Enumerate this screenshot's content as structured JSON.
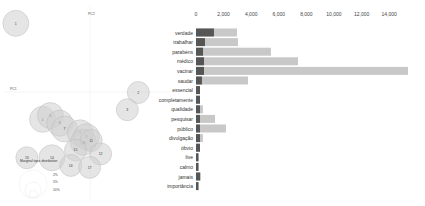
{
  "map": {
    "xaxis_label": "PC1",
    "yaxis_label": "PC2",
    "legend_title": "Marginal topic distribution",
    "legend_sizes": [
      "2%",
      "5%",
      "10%"
    ],
    "colors": {
      "circle_fill": "#d0d0d0",
      "circle_stroke": "#bdbdbd",
      "center": "#444444"
    },
    "topics": [
      {
        "id": "1",
        "x": 0.05,
        "y": 0.92,
        "size": 3
      },
      {
        "id": "2",
        "x": 0.83,
        "y": 0.56,
        "size": 2
      },
      {
        "id": "3",
        "x": 0.76,
        "y": 0.47,
        "size": 2
      },
      {
        "id": "4",
        "x": 0.22,
        "y": 0.42,
        "size": 3
      },
      {
        "id": "5",
        "x": 0.27,
        "y": 0.44,
        "size": 3
      },
      {
        "id": "6",
        "x": 0.33,
        "y": 0.4,
        "size": 3
      },
      {
        "id": "7",
        "x": 0.36,
        "y": 0.37,
        "size": 3
      },
      {
        "id": "8",
        "x": 0.46,
        "y": 0.35,
        "size": 3
      },
      {
        "id": "9",
        "x": 0.5,
        "y": 0.33,
        "size": 3
      },
      {
        "id": "10",
        "x": 0.48,
        "y": 0.3,
        "size": 3
      },
      {
        "id": "11",
        "x": 0.53,
        "y": 0.31,
        "size": 2
      },
      {
        "id": "12",
        "x": 0.59,
        "y": 0.24,
        "size": 2
      },
      {
        "id": "13",
        "x": 0.12,
        "y": 0.22,
        "size": 2
      },
      {
        "id": "14",
        "x": 0.28,
        "y": 0.22,
        "size": 3
      },
      {
        "id": "15",
        "x": 0.43,
        "y": 0.26,
        "size": 2
      },
      {
        "id": "16",
        "x": 0.4,
        "y": 0.18,
        "size": 2
      },
      {
        "id": "17",
        "x": 0.52,
        "y": 0.17,
        "size": 2
      }
    ]
  },
  "chart_data": {
    "type": "bar",
    "orientation": "horizontal",
    "stacked": "overlay",
    "title": "",
    "xlabel": "",
    "ylabel": "",
    "xlim": [
      0,
      15500
    ],
    "xticks": [
      0,
      2000,
      4000,
      6000,
      8000,
      10000,
      12000,
      14000
    ],
    "xtick_labels": [
      "0",
      "2,000",
      "4,000",
      "6,000",
      "8,000",
      "10,000",
      "12,000",
      "14,000"
    ],
    "categories": [
      "verdade",
      "trabalhar",
      "parabéns",
      "médico",
      "vacinar",
      "saudar",
      "essencial",
      "completamente",
      "qualidade",
      "pesquisar",
      "público",
      "divulgação",
      "óbvio",
      "live",
      "calmo",
      "jamais",
      "importância"
    ],
    "series": [
      {
        "name": "Overall term frequency",
        "color": "#c8c8c8",
        "values": [
          2970,
          3040,
          5430,
          7390,
          15360,
          3770,
          290,
          290,
          500,
          1380,
          2170,
          500,
          290,
          180,
          180,
          360,
          180
        ]
      },
      {
        "name": "Estimated term frequency within the selected topic",
        "color": "#555555",
        "values": [
          1300,
          650,
          510,
          580,
          580,
          430,
          290,
          290,
          290,
          290,
          290,
          290,
          290,
          180,
          180,
          290,
          180
        ]
      }
    ],
    "grid": false,
    "legend": "none"
  }
}
